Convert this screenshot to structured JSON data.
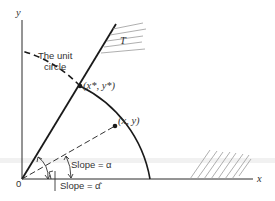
{
  "figure": {
    "title": "",
    "labels": {
      "y_axis": "y",
      "x_axis": "x",
      "origin": "0",
      "unit_circle_line1": "The unit",
      "unit_circle_line2": "circle",
      "point_star": "(x*, y*)",
      "point": "(x, y)",
      "region_T": "T",
      "slope_alpha": "Slope = α",
      "slope_alpha_hat": "Slope = α̂"
    },
    "colors": {
      "ink": "#1a1a1a",
      "hatch": "#9a9a9a",
      "text": "#333333"
    }
  },
  "geometry": {
    "origin": [
      22,
      179
    ],
    "unit_radius_px": 128,
    "point_star_px": [
      80,
      86
    ],
    "point_px": [
      115,
      126
    ]
  }
}
